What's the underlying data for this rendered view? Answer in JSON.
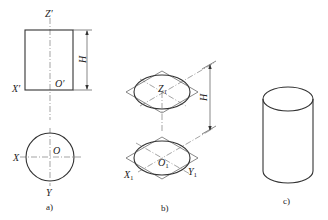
{
  "figure": {
    "panels": [
      {
        "id": "a",
        "caption": "a)",
        "description": "Orthographic views of a cylinder: front view (rectangle) and top view (circle)",
        "labels": {
          "z_axis": "Z′",
          "x_axis_front": "X′",
          "origin_front": "O′",
          "height": "H",
          "x_axis_top": "X",
          "origin_top": "O",
          "y_axis_top": "Y"
        }
      },
      {
        "id": "b",
        "caption": "b)",
        "description": "Isometric construction: top and bottom ellipses inscribed in rhombi separated by height H",
        "labels": {
          "z_axis": "Z",
          "z_sub": "1",
          "origin": "O",
          "origin_sub": "1",
          "x_axis": "X",
          "x_sub": "1",
          "y_axis": "Y",
          "y_sub": "1",
          "height": "H"
        }
      },
      {
        "id": "c",
        "caption": "c)",
        "description": "Finished isometric drawing of the cylinder"
      }
    ]
  }
}
